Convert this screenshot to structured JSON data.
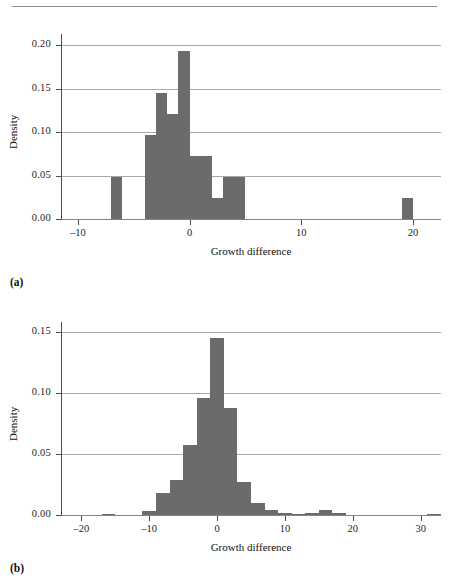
{
  "figure": {
    "panel_a_letter": "(a)",
    "panel_b_letter": "(b)"
  },
  "chart_data": [
    {
      "id": "panel-a",
      "type": "bar",
      "title": "",
      "xlabel": "Growth difference",
      "ylabel": "Density",
      "xlim": [
        -11.5,
        22.5
      ],
      "ylim": [
        0,
        0.213
      ],
      "xticks": [
        -10,
        0,
        10,
        20
      ],
      "xticklabels": [
        "–10",
        "0",
        "10",
        "20"
      ],
      "yticks": [
        0.0,
        0.05,
        0.1,
        0.15,
        0.2
      ],
      "yticklabels": [
        "0.00",
        "0.05",
        "0.10",
        "0.15",
        "0.20"
      ],
      "grid": "horizontal",
      "legend": "none",
      "bin_width": 1,
      "bins": [
        {
          "x0": -7,
          "x1": -6,
          "value": 0.048
        },
        {
          "x0": -4,
          "x1": -3,
          "value": 0.097
        },
        {
          "x0": -3,
          "x1": -2,
          "value": 0.145
        },
        {
          "x0": -2,
          "x1": -1,
          "value": 0.121
        },
        {
          "x0": -1,
          "x1": 0,
          "value": 0.193
        },
        {
          "x0": 0,
          "x1": 1,
          "value": 0.072
        },
        {
          "x0": 1,
          "x1": 2,
          "value": 0.072
        },
        {
          "x0": 2,
          "x1": 3,
          "value": 0.024
        },
        {
          "x0": 3,
          "x1": 4,
          "value": 0.048
        },
        {
          "x0": 4,
          "x1": 5,
          "value": 0.048
        },
        {
          "x0": 19,
          "x1": 20,
          "value": 0.024
        }
      ]
    },
    {
      "id": "panel-b",
      "type": "bar",
      "title": "",
      "xlabel": "Growth difference",
      "ylabel": "Density",
      "xlim": [
        -23,
        33
      ],
      "ylim": [
        0,
        0.158
      ],
      "xticks": [
        -20,
        -10,
        0,
        10,
        20,
        30
      ],
      "xticklabels": [
        "–20",
        "–10",
        "0",
        "10",
        "20",
        "30"
      ],
      "yticks": [
        0.0,
        0.05,
        0.1,
        0.15
      ],
      "yticklabels": [
        "0.00",
        "0.05",
        "0.10",
        "0.15"
      ],
      "grid": "horizontal",
      "legend": "none",
      "bin_width": 2,
      "bins": [
        {
          "x0": -17,
          "x1": -15,
          "value": 0.0008
        },
        {
          "x0": -11,
          "x1": -9,
          "value": 0.0035
        },
        {
          "x0": -9,
          "x1": -7,
          "value": 0.018
        },
        {
          "x0": -7,
          "x1": -5,
          "value": 0.029
        },
        {
          "x0": -5,
          "x1": -3,
          "value": 0.057
        },
        {
          "x0": -3,
          "x1": -1,
          "value": 0.096
        },
        {
          "x0": -1,
          "x1": 1,
          "value": 0.145
        },
        {
          "x0": 1,
          "x1": 3,
          "value": 0.088
        },
        {
          "x0": 3,
          "x1": 5,
          "value": 0.027
        },
        {
          "x0": 5,
          "x1": 7,
          "value": 0.01
        },
        {
          "x0": 7,
          "x1": 9,
          "value": 0.004
        },
        {
          "x0": 9,
          "x1": 11,
          "value": 0.002
        },
        {
          "x0": 11,
          "x1": 13,
          "value": 0.0008
        },
        {
          "x0": 13,
          "x1": 15,
          "value": 0.002
        },
        {
          "x0": 15,
          "x1": 17,
          "value": 0.004
        },
        {
          "x0": 17,
          "x1": 19,
          "value": 0.002
        },
        {
          "x0": 31,
          "x1": 33,
          "value": 0.0008
        }
      ]
    }
  ],
  "colors": {
    "bar": "#6b6b6b",
    "grid": "#9a9a9a",
    "axis": "#4d4d4d",
    "text": "#111111",
    "background": "#ffffff"
  }
}
